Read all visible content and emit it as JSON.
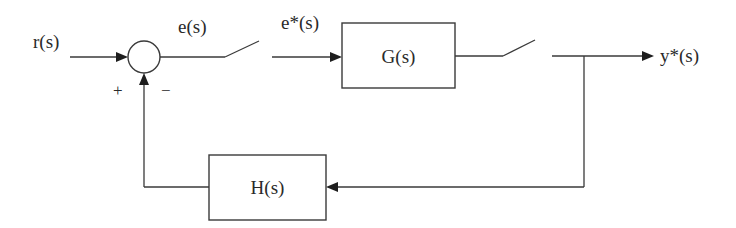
{
  "diagram": {
    "type": "sampled-data feedback control block diagram",
    "signals": {
      "input": "r(s)",
      "error": "e(s)",
      "sampled_error": "e*(s)",
      "output": "y*(s)"
    },
    "blocks": {
      "forward": "G(s)",
      "feedback": "H(s)"
    },
    "summing_junction": {
      "plus_sign": "+",
      "minus_sign": "−"
    },
    "samplers": [
      {
        "name": "error-sampler",
        "position": "between e(s) and e*(s)"
      },
      {
        "name": "output-sampler",
        "position": "after G(s)"
      }
    ],
    "colors": {
      "line": "#3a3a3a",
      "background": "#ffffff"
    }
  }
}
